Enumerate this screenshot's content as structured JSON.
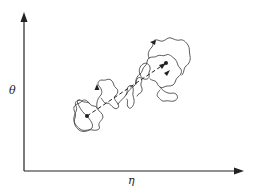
{
  "diagram": {
    "axes": {
      "y_label": "θ",
      "x_label": "η"
    },
    "elements": {
      "start_point": "start-dot",
      "end_point": "end-dot",
      "mean_path": "dashed-line",
      "trajectories": "random-walk-paths"
    },
    "colors": {
      "ink": "#222222",
      "background": "#ffffff"
    }
  }
}
